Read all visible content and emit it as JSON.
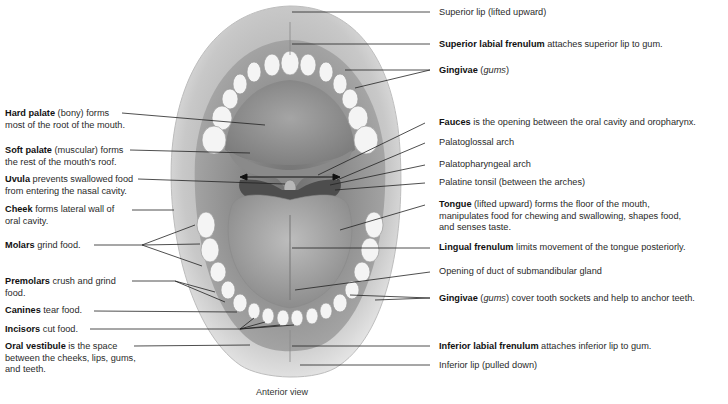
{
  "figure": {
    "caption": "Anterior view",
    "left_labels": [
      {
        "id": "hard-palate",
        "bold": "Hard palate",
        "rest": " (bony) forms",
        "line2": "most of the root of the mouth."
      },
      {
        "id": "soft-palate",
        "bold": "Soft palate",
        "rest": " (muscular) forms",
        "line2": "the rest of the mouth's roof."
      },
      {
        "id": "uvula",
        "bold": "Uvula",
        "rest": " prevents swallowed food",
        "line2": "from entering the nasal cavity."
      },
      {
        "id": "cheek",
        "bold": "Cheek",
        "rest": " forms lateral wall of",
        "line2": "oral cavity."
      },
      {
        "id": "molars",
        "bold": "Molars",
        "rest": " grind food.",
        "line2": ""
      },
      {
        "id": "premolars",
        "bold": "Premolars",
        "rest": " crush and grind",
        "line2": "food."
      },
      {
        "id": "canines",
        "bold": "Canines",
        "rest": " tear food.",
        "line2": ""
      },
      {
        "id": "incisors",
        "bold": "Incisors",
        "rest": " cut food.",
        "line2": ""
      },
      {
        "id": "oral-vestibule",
        "bold": "Oral vestibule",
        "rest": " is the space",
        "line2": "between the cheeks, lips, gums,",
        "line3": "and teeth."
      }
    ],
    "right_labels": [
      {
        "id": "superior-lip",
        "bold": "",
        "rest": "Superior lip (lifted upward)"
      },
      {
        "id": "superior-labial-frenulum",
        "bold": "Superior labial frenulum",
        "rest": " attaches superior lip to gum."
      },
      {
        "id": "gingivae-upper",
        "bold": "Gingivae",
        "italic": "gums",
        "rest": ""
      },
      {
        "id": "fauces",
        "bold": "Fauces",
        "rest": " is the opening between the oral cavity and oropharynx."
      },
      {
        "id": "palatoglossal-arch",
        "bold": "",
        "rest": "Palatoglossal arch"
      },
      {
        "id": "palatopharyngeal-arch",
        "bold": "",
        "rest": "Palatopharyngeal arch"
      },
      {
        "id": "palatine-tonsil",
        "bold": "",
        "rest": "Palatine tonsil (between the arches)"
      },
      {
        "id": "tongue",
        "bold": "Tongue",
        "rest": " (lifted upward) forms the floor of the mouth,",
        "line2": "manipulates food for chewing and swallowing, shapes food,",
        "line3": "and senses taste."
      },
      {
        "id": "lingual-frenulum",
        "bold": "Lingual frenulum",
        "rest": " limits movement of the tongue posteriorly."
      },
      {
        "id": "submandibular-duct",
        "bold": "",
        "rest": "Opening of duct of submandibular gland"
      },
      {
        "id": "gingivae-lower",
        "bold": "Gingivae",
        "italic": "gums",
        "rest": " cover tooth sockets and help to anchor teeth."
      },
      {
        "id": "inferior-labial-frenulum",
        "bold": "Inferior labial frenulum",
        "rest": " attaches inferior lip to gum."
      },
      {
        "id": "inferior-lip",
        "bold": "",
        "rest": "Inferior lip (pulled down)"
      }
    ]
  }
}
